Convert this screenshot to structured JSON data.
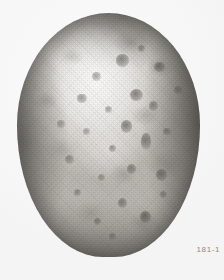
{
  "image": {
    "subject_label": "potato-tuber-specimen",
    "caption": "181-1",
    "caption_color": "#8c8a87",
    "background_color": "#fdfdfd",
    "specimen": {
      "common_name": "potato tuber",
      "shape": "oval",
      "orientation": "vertical",
      "surface": "mottled, russeted skin with scattered dark eyes",
      "body_light_tone": "#e6e4e0",
      "body_mid_tone": "#c2bfb8",
      "body_shadow_tone": "#8e8b85",
      "highlight_tone": "#f2f1ee",
      "eye_spot_color": "#3a3834",
      "bounds": {
        "left": 17,
        "top": 13,
        "width": 183,
        "height": 244
      }
    },
    "eyes": [
      {
        "x": 54,
        "y": 17,
        "w": 7,
        "h": 5,
        "o": 0.55
      },
      {
        "x": 41,
        "y": 24,
        "w": 5,
        "h": 4,
        "o": 0.42
      },
      {
        "x": 66,
        "y": 13,
        "w": 4,
        "h": 3,
        "o": 0.4
      },
      {
        "x": 75,
        "y": 20,
        "w": 6,
        "h": 4,
        "o": 0.5
      },
      {
        "x": 33,
        "y": 33,
        "w": 5,
        "h": 4,
        "o": 0.46
      },
      {
        "x": 62,
        "y": 31,
        "w": 7,
        "h": 5,
        "o": 0.58
      },
      {
        "x": 48,
        "y": 38,
        "w": 4,
        "h": 3,
        "o": 0.4
      },
      {
        "x": 72,
        "y": 36,
        "w": 5,
        "h": 4,
        "o": 0.48
      },
      {
        "x": 57,
        "y": 44,
        "w": 6,
        "h": 5,
        "o": 0.56
      },
      {
        "x": 36,
        "y": 47,
        "w": 4,
        "h": 3,
        "o": 0.38
      },
      {
        "x": 68,
        "y": 49,
        "w": 5,
        "h": 7,
        "o": 0.52
      },
      {
        "x": 50,
        "y": 54,
        "w": 4,
        "h": 3,
        "o": 0.44
      },
      {
        "x": 80,
        "y": 47,
        "w": 4,
        "h": 3,
        "o": 0.4
      },
      {
        "x": 26,
        "y": 58,
        "w": 5,
        "h": 4,
        "o": 0.42
      },
      {
        "x": 60,
        "y": 62,
        "w": 5,
        "h": 4,
        "o": 0.46
      },
      {
        "x": 44,
        "y": 66,
        "w": 4,
        "h": 3,
        "o": 0.38
      },
      {
        "x": 76,
        "y": 64,
        "w": 6,
        "h": 5,
        "o": 0.5
      },
      {
        "x": 31,
        "y": 72,
        "w": 4,
        "h": 3,
        "o": 0.4
      },
      {
        "x": 55,
        "y": 76,
        "w": 5,
        "h": 4,
        "o": 0.48
      },
      {
        "x": 67,
        "y": 81,
        "w": 6,
        "h": 5,
        "o": 0.58
      },
      {
        "x": 42,
        "y": 84,
        "w": 4,
        "h": 3,
        "o": 0.42
      },
      {
        "x": 22,
        "y": 44,
        "w": 4,
        "h": 3,
        "o": 0.38
      },
      {
        "x": 86,
        "y": 30,
        "w": 4,
        "h": 3,
        "o": 0.36
      },
      {
        "x": 50,
        "y": 90,
        "w": 4,
        "h": 3,
        "o": 0.36
      },
      {
        "x": 78,
        "y": 73,
        "w": 4,
        "h": 3,
        "o": 0.38
      }
    ]
  }
}
